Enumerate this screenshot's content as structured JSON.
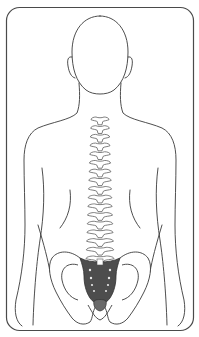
{
  "illustration": {
    "title": "Human back with spine and sacrum highlighted",
    "view": "posterior",
    "highlighted_region": "sacrum",
    "colors": {
      "outline": "#3a3a3a",
      "background": "#ffffff",
      "frame": "#4a4a4a",
      "sacrum_fill": "#4d4d4d",
      "coccyx_fill": "#6a6a6a",
      "foramina": "#e8e8e8"
    },
    "labels": []
  }
}
